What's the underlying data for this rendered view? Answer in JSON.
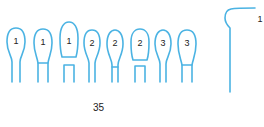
{
  "figure": {
    "stroke_color": "#4bb3e3",
    "loops": [
      {
        "label": "1",
        "variant": "simple"
      },
      {
        "label": "1",
        "variant": "crossbar"
      },
      {
        "label": "1",
        "variant": "split-bridge"
      },
      {
        "label": "2",
        "variant": "pinched"
      },
      {
        "label": "2",
        "variant": "pinched-crossbar"
      },
      {
        "label": "2",
        "variant": "flat-bridge"
      },
      {
        "label": "3",
        "variant": "pinched"
      },
      {
        "label": "3",
        "variant": "crossbar"
      }
    ],
    "side_loop": {
      "label": "1"
    }
  },
  "page_number": "35"
}
